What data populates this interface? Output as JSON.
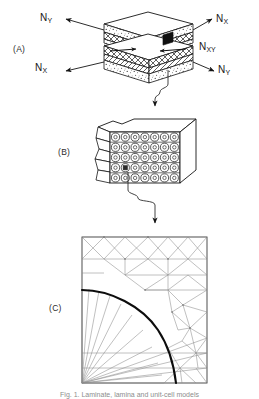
{
  "figure": {
    "caption": "Fig. 1. Laminate, lamina and unit-cell models",
    "background_color": "#ffffff",
    "line_color": "#1a1a1a"
  },
  "panels": [
    {
      "id": "A",
      "label": "(A)",
      "name": "laminate-block",
      "description": "Exploded laminate block with stacked plies under in-plane loads"
    },
    {
      "id": "B",
      "label": "(B)",
      "name": "lamina-fiber-array",
      "description": "Magnified lamina block showing rows of circular fibres in matrix"
    },
    {
      "id": "C",
      "label": "(C)",
      "name": "unit-cell-mesh",
      "description": "Finite element mesh of a quarter unit cell with fibre-matrix interface arc"
    }
  ],
  "forces": [
    {
      "name": "force-ny-top-left",
      "symbol": "N",
      "subscript": "Y",
      "text": "NY",
      "position": "top-left",
      "direction": "up-left"
    },
    {
      "name": "force-nx-top-right",
      "symbol": "N",
      "subscript": "X",
      "text": "NX",
      "position": "top-right",
      "direction": "up-right"
    },
    {
      "name": "force-nxy-mid-right",
      "symbol": "N",
      "subscript": "XY",
      "text": "NXY",
      "position": "middle-right",
      "direction": "shear"
    },
    {
      "name": "force-nx-bottom-left",
      "symbol": "N",
      "subscript": "X",
      "text": "NX",
      "position": "bottom-left",
      "direction": "down-left"
    },
    {
      "name": "force-ny-bottom-right",
      "symbol": "N",
      "subscript": "Y",
      "text": "NY",
      "position": "bottom-right",
      "direction": "down-right"
    }
  ],
  "lamina": {
    "fiber_rows": 5,
    "fibers_per_row": 7,
    "marker": "highlighted-fiber"
  },
  "mesh": {
    "shape": "square",
    "interface": "quarter-circle-arc",
    "fan_origin": "bottom-left-corner"
  },
  "connectors": [
    {
      "name": "connector-a-to-b",
      "from": "A",
      "to": "B",
      "style": "zigzag-arrow"
    },
    {
      "name": "connector-b-to-c",
      "from": "B",
      "to": "C",
      "style": "zigzag-arrow"
    }
  ]
}
